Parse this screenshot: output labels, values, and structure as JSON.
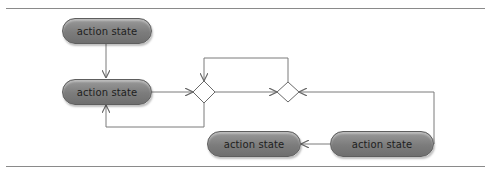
{
  "diagram": {
    "type": "UML activity diagram",
    "nodes": [
      {
        "id": "a1",
        "kind": "action",
        "label": "action state"
      },
      {
        "id": "a2",
        "kind": "action",
        "label": "action state"
      },
      {
        "id": "d1",
        "kind": "decision"
      },
      {
        "id": "d2",
        "kind": "merge"
      },
      {
        "id": "a3",
        "kind": "action",
        "label": "action state"
      },
      {
        "id": "a4",
        "kind": "action",
        "label": "action state"
      }
    ],
    "edges": [
      {
        "from": "a1",
        "to": "a2"
      },
      {
        "from": "a2",
        "to": "d1"
      },
      {
        "from": "d1",
        "to": "a2"
      },
      {
        "from": "d2",
        "to": "d1"
      },
      {
        "from": "d1",
        "to": "d2"
      },
      {
        "from": "a4",
        "to": "d2"
      },
      {
        "from": "a4",
        "to": "a3"
      }
    ],
    "colors": {
      "node_fill": "#808080",
      "line": "#7a7a7a"
    }
  }
}
